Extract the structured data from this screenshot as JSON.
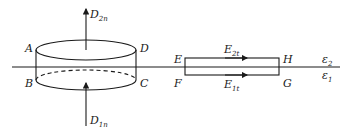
{
  "diagram": {
    "cylinder": {
      "corners": {
        "top_left": "A",
        "top_right": "D",
        "bottom_left": "B",
        "bottom_right": "C"
      },
      "flux_up": {
        "symbol": "D",
        "subscript": "2n"
      },
      "flux_in": {
        "symbol": "D",
        "subscript": "1n"
      }
    },
    "loop": {
      "corners": {
        "top_left": "E",
        "bottom_left": "F",
        "top_right": "H",
        "bottom_right": "G"
      },
      "top_field": {
        "symbol": "E",
        "subscript": "2t"
      },
      "bottom_field": {
        "symbol": "E",
        "subscript": "1t"
      }
    },
    "media": {
      "upper": {
        "symbol": "ε",
        "subscript": "2"
      },
      "lower": {
        "symbol": "ε",
        "subscript": "1"
      }
    },
    "colors": {
      "ink": "#1a1a1a",
      "background": "#ffffff"
    }
  }
}
